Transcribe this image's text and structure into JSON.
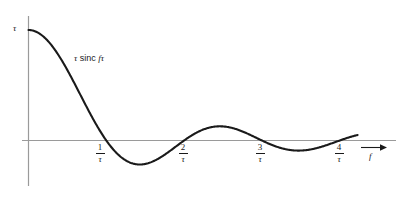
{
  "figure": {
    "kind": "sinc-function-plot",
    "background_color": "#ffffff",
    "curve_color": "#1a1a1a",
    "axis_color": "#999999",
    "y_axis_label": "τ",
    "x_axis_label": "f",
    "curve_label_parts": {
      "tau": "τ",
      "sinc": " sinc ",
      "f": "f",
      "tau2": "τ"
    },
    "curve_label_full": "τ sinc fτ",
    "x_tick_labels": [
      {
        "numerator": "1",
        "denominator": "τ"
      },
      {
        "numerator": "2",
        "denominator": "τ"
      },
      {
        "numerator": "3",
        "denominator": "τ"
      },
      {
        "numerator": "4",
        "denominator": "τ"
      }
    ],
    "arrow": "right-arrow"
  },
  "chart_data": {
    "type": "line",
    "title": "",
    "subtitle": "",
    "xlabel": "f",
    "ylabel": "τ",
    "legend": [
      "τ sinc fτ"
    ],
    "grid": false,
    "annotations": [
      "τ sinc fτ"
    ],
    "function": "tau * sinc(f*tau) = tau * sin(pi*f*tau)/(pi*f*tau)",
    "xlim": [
      0,
      4.35
    ],
    "ylim": [
      -0.25,
      1.0
    ],
    "x_tick_values": [
      1,
      2,
      3,
      4
    ],
    "x_tick_text": [
      "1/τ",
      "2/τ",
      "3/τ",
      "4/τ"
    ],
    "y_tick_values": [
      1
    ],
    "y_tick_text": [
      "τ"
    ],
    "zero_crossings": [
      1,
      2,
      3,
      4
    ],
    "extrema": [
      {
        "x": 0.0,
        "y": 1.0,
        "kind": "max"
      },
      {
        "x": 1.43,
        "y": -0.217,
        "kind": "min"
      },
      {
        "x": 2.46,
        "y": 0.128,
        "kind": "max"
      },
      {
        "x": 3.47,
        "y": -0.091,
        "kind": "min"
      }
    ],
    "x": [
      0,
      0.2,
      0.4,
      0.6,
      0.8,
      1.0,
      1.2,
      1.4,
      1.6,
      1.8,
      2.0,
      2.2,
      2.4,
      2.6,
      2.8,
      3.0,
      3.2,
      3.4,
      3.6,
      3.8,
      4.0,
      4.2
    ],
    "values": [
      1.0,
      0.935,
      0.757,
      0.505,
      0.234,
      0.0,
      -0.156,
      -0.216,
      -0.189,
      -0.104,
      0.0,
      0.085,
      0.126,
      0.12,
      0.074,
      0.0,
      -0.062,
      -0.09,
      -0.084,
      -0.049,
      0.0,
      0.045
    ]
  }
}
